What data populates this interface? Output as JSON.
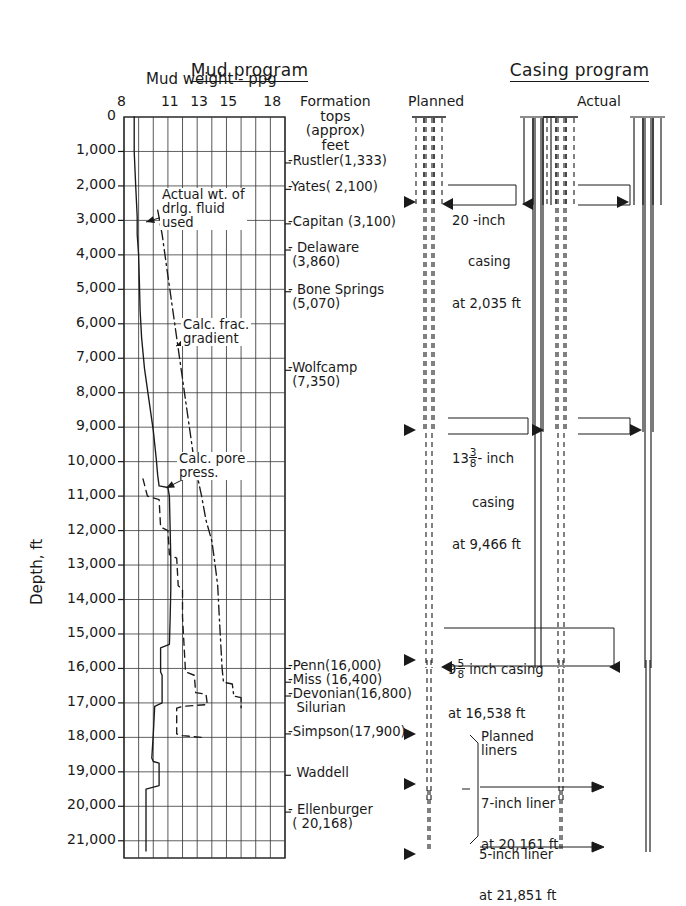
{
  "figure": {
    "headers": {
      "mud_program": "Mud program",
      "casing_program": "Casing program"
    },
    "mud_axis_title": "Mud weight - ppg",
    "depth_axis_title": "Depth, ft",
    "column_headers": {
      "formation_tops": "Formation\ntops\n(approx)\nfeet",
      "planned": "Planned",
      "actual": "Actual"
    }
  },
  "chart_data": {
    "type": "line",
    "title": "Mud program",
    "xlabel": "Mud weight - ppg",
    "ylabel": "Depth, ft",
    "xlim": [
      8,
      19
    ],
    "ylim": [
      0,
      21500
    ],
    "grid": true,
    "y_invert": true,
    "xticks": [
      8,
      11,
      13,
      15,
      18
    ],
    "xtick_labels": [
      "8",
      "11",
      "13",
      "15",
      "18"
    ],
    "x_gridlines": [
      8,
      9,
      10,
      11,
      12,
      13,
      14,
      15,
      16,
      17,
      18,
      19
    ],
    "yticks": [
      0,
      1000,
      2000,
      3000,
      4000,
      5000,
      6000,
      7000,
      8000,
      9000,
      10000,
      11000,
      12000,
      13000,
      14000,
      15000,
      16000,
      17000,
      18000,
      19000,
      20000,
      21000
    ],
    "ytick_labels": [
      "0",
      "1,000",
      "2,000",
      "3,000",
      "4,000",
      "5,000",
      "6,000",
      "7,000",
      "8,000",
      "9,000",
      "10,000",
      "11,000",
      "12,000",
      "13,000",
      "14,000",
      "15,000",
      "16,000",
      "17,000",
      "18,000",
      "19,000",
      "20,000",
      "21,000"
    ],
    "legend_position": "inline-annotations",
    "series": [
      {
        "name": "Actual wt. of drlg. fluid used",
        "style": "solid",
        "points": [
          [
            8.7,
            0
          ],
          [
            8.7,
            1000
          ],
          [
            8.8,
            2000
          ],
          [
            8.9,
            2900
          ],
          [
            8.9,
            3400
          ],
          [
            9.0,
            4000
          ],
          [
            9.05,
            4800
          ],
          [
            9.1,
            5600
          ],
          [
            9.2,
            6400
          ],
          [
            9.4,
            7300
          ],
          [
            9.7,
            8200
          ],
          [
            10.0,
            9100
          ],
          [
            10.2,
            9900
          ],
          [
            10.3,
            10400
          ],
          [
            10.4,
            10700
          ],
          [
            11.0,
            10750
          ],
          [
            11.1,
            11000
          ],
          [
            11.15,
            11900
          ],
          [
            11.2,
            12800
          ],
          [
            11.2,
            13700
          ],
          [
            11.15,
            14600
          ],
          [
            11.1,
            15300
          ],
          [
            10.5,
            15400
          ],
          [
            10.5,
            16100
          ],
          [
            10.6,
            16200
          ],
          [
            10.6,
            17000
          ],
          [
            10.1,
            17100
          ],
          [
            10.0,
            17900
          ],
          [
            9.9,
            18600
          ],
          [
            10.0,
            18700
          ],
          [
            10.4,
            18750
          ],
          [
            10.4,
            19400
          ],
          [
            9.5,
            19500
          ],
          [
            9.5,
            20800
          ],
          [
            9.5,
            21300
          ]
        ]
      },
      {
        "name": "Calc. frac. gradient",
        "style": "dashdot",
        "points": [
          [
            10.3,
            2700
          ],
          [
            10.6,
            3400
          ],
          [
            10.9,
            4300
          ],
          [
            11.2,
            5200
          ],
          [
            11.5,
            6100
          ],
          [
            11.8,
            7000
          ],
          [
            12.1,
            7900
          ],
          [
            12.4,
            8800
          ],
          [
            12.7,
            9700
          ],
          [
            13.0,
            10400
          ],
          [
            13.3,
            11000
          ],
          [
            13.6,
            11700
          ],
          [
            14.0,
            12300
          ],
          [
            14.2,
            12900
          ],
          [
            14.4,
            13600
          ],
          [
            14.5,
            14400
          ],
          [
            14.6,
            15200
          ],
          [
            14.7,
            16000
          ],
          [
            14.8,
            16400
          ],
          [
            15.4,
            16450
          ],
          [
            15.5,
            16800
          ],
          [
            16.0,
            16850
          ],
          [
            16.0,
            17200
          ]
        ]
      },
      {
        "name": "Calc. pore press.",
        "style": "dashed",
        "points": [
          [
            9.3,
            10500
          ],
          [
            9.6,
            11000
          ],
          [
            10.4,
            11100
          ],
          [
            10.5,
            11900
          ],
          [
            11.0,
            12000
          ],
          [
            11.1,
            12700
          ],
          [
            11.6,
            12800
          ],
          [
            11.7,
            13600
          ],
          [
            12.0,
            13700
          ],
          [
            12.0,
            14500
          ],
          [
            12.1,
            15300
          ],
          [
            12.2,
            16100
          ],
          [
            12.8,
            16200
          ],
          [
            12.9,
            16700
          ],
          [
            13.6,
            16750
          ],
          [
            13.7,
            17050
          ],
          [
            12.0,
            17100
          ],
          [
            11.6,
            17150
          ],
          [
            11.6,
            17900
          ],
          [
            12.0,
            17950
          ],
          [
            13.3,
            18000
          ],
          [
            13.4,
            18100
          ]
        ]
      }
    ],
    "annotations": [
      {
        "text": "Actual wt. of\ndrlg. fluid\nused",
        "depth": 3000,
        "mud_weight": 10.0
      },
      {
        "text": "Calc. frac.\ngradient",
        "depth": 6700,
        "mud_weight": 12.5
      },
      {
        "text": "Calc. pore\npress.",
        "depth": 10700,
        "mud_weight": 12.4
      }
    ]
  },
  "formation_tops": [
    {
      "label": "-Rustler(1,333)",
      "depth": 1333
    },
    {
      "label": "-Yates( 2,100)",
      "depth": 2100
    },
    {
      "label": "-Capitan (3,100)",
      "depth": 3100
    },
    {
      "label": "- Delaware\n (3,860)",
      "depth": 3860
    },
    {
      "label": "- Bone Springs\n (5,070)",
      "depth": 5070
    },
    {
      "label": "-Wolfcamp\n (7,350)",
      "depth": 7350
    },
    {
      "label": "-Penn(16,000)",
      "depth": 16000
    },
    {
      "label": "-Miss (16,400)",
      "depth": 16400
    },
    {
      "label": "-Devonian(16,800)\n  Silurian",
      "depth": 16800
    },
    {
      "label": "-Simpson(17,900)",
      "depth": 17900
    },
    {
      "label": "  Waddell",
      "depth": 19100
    },
    {
      "label": "- Ellenburger\n ( 20,168)",
      "depth": 20168
    }
  ],
  "casing_program": {
    "planned_label": "Planned",
    "actual_label": "Actual",
    "strings": [
      {
        "name": "surface-casing",
        "size_whole": "20",
        "size_frac_num": "",
        "size_frac_den": "",
        "size_unit": "-inch",
        "type": "casing",
        "set_depth_text": "at 2,035 ft",
        "set_depth": 2035,
        "line1": "20 -inch",
        "line2": "casing",
        "line3": "at 2,035 ft"
      },
      {
        "name": "intermediate-casing",
        "size_whole": "13",
        "size_frac_num": "3",
        "size_frac_den": "8",
        "size_unit": "- inch",
        "type": "casing",
        "set_depth_text": "at 9,466 ft",
        "set_depth": 9466,
        "line2": "casing",
        "line3": "at 9,466 ft"
      },
      {
        "name": "production-casing",
        "size_whole": "9",
        "size_frac_num": "5",
        "size_frac_den": "8",
        "size_unit": " inch casing",
        "type": "casing",
        "set_depth_text": "at 16,538 ft",
        "set_depth": 16538,
        "line3": "at 16,538 ft"
      }
    ],
    "liners_label": "Planned\nliners",
    "liners": [
      {
        "name": "seven-inch-liner",
        "line1": "7-inch liner",
        "line2": "at 20,161 ft",
        "set_depth": 20161
      },
      {
        "name": "five-inch-liner",
        "line1": "5-inch liner",
        "line2": "at 21,851 ft",
        "set_depth": 21851
      }
    ]
  },
  "colors": {
    "ink": "#1a1a1a",
    "grid": "#3a3a3a",
    "background": "#ffffff"
  }
}
